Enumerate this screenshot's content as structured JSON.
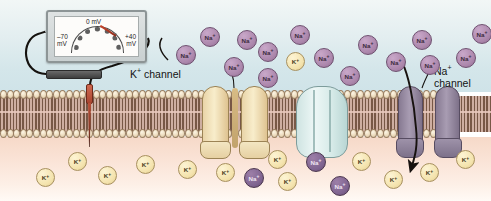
{
  "figure": {
    "type": "cell-membrane-diagram"
  },
  "voltmeter": {
    "name": "voltmeter",
    "scale_min_label": "–70\nmV",
    "scale_min_top": "–70",
    "scale_min_bottom": "mV",
    "scale_zero": "0 mV",
    "scale_max_top": "+40",
    "scale_max_bottom": "mV",
    "needle_reading_mv": -70,
    "needle_angle_deg": 33
  },
  "electrodes": {
    "reference_electrode": "reference-electrode",
    "microelectrode": "intracellular-microelectrode"
  },
  "labels": {
    "k_channel_text": "K",
    "k_channel_sup": "+",
    "k_channel_suffix": " channel",
    "na_channel_text": "Na",
    "na_channel_sup": "+",
    "na_channel_suffix": "channel"
  },
  "membrane": {
    "name": "phospholipid-bilayer",
    "head_count": 69,
    "head_color": "#f6ead2",
    "tail_color": "#6d4b38"
  },
  "compartments": {
    "extracellular": {
      "name": "extracellular-fluid",
      "color": "#d4e6ea"
    },
    "intracellular": {
      "name": "cytoplasm",
      "color": "#fae3d6"
    }
  },
  "channels": [
    {
      "name": "k-channel-protein",
      "label": "K+ channel",
      "color": "#e9d4a8",
      "state": "open",
      "x": 202
    },
    {
      "name": "closed-channel-protein",
      "label": "",
      "color": "#cfe4e2",
      "state": "closed",
      "x": 296
    },
    {
      "name": "na-channel-protein",
      "label": "Na+ channel",
      "color": "#a89cb2",
      "state": "open",
      "x": 398
    }
  ],
  "flow_arrow": {
    "name": "sodium-influx-arrow",
    "direction": "inward",
    "ion": "Na+"
  },
  "ions": {
    "sodium_symbol": "Na",
    "potassium_symbol": "K",
    "charge": "+",
    "extracellular_sodium": [
      {
        "x": 176,
        "y": 45
      },
      {
        "x": 200,
        "y": 27
      },
      {
        "x": 224,
        "y": 57
      },
      {
        "x": 237,
        "y": 30
      },
      {
        "x": 258,
        "y": 42
      },
      {
        "x": 258,
        "y": 68
      },
      {
        "x": 290,
        "y": 25
      },
      {
        "x": 314,
        "y": 48
      },
      {
        "x": 340,
        "y": 66
      },
      {
        "x": 358,
        "y": 35
      },
      {
        "x": 386,
        "y": 52
      },
      {
        "x": 412,
        "y": 30
      },
      {
        "x": 420,
        "y": 55
      },
      {
        "x": 456,
        "y": 48
      },
      {
        "x": 472,
        "y": 24
      }
    ],
    "extracellular_potassium": [
      {
        "x": 286,
        "y": 52
      }
    ],
    "intracellular_potassium": [
      {
        "x": 36,
        "y": 168
      },
      {
        "x": 68,
        "y": 152
      },
      {
        "x": 98,
        "y": 166
      },
      {
        "x": 136,
        "y": 155
      },
      {
        "x": 178,
        "y": 160
      },
      {
        "x": 216,
        "y": 163
      },
      {
        "x": 268,
        "y": 150
      },
      {
        "x": 278,
        "y": 172
      },
      {
        "x": 352,
        "y": 152
      },
      {
        "x": 384,
        "y": 170
      },
      {
        "x": 420,
        "y": 163
      },
      {
        "x": 456,
        "y": 150
      }
    ],
    "intracellular_sodium": [
      {
        "x": 244,
        "y": 168
      },
      {
        "x": 306,
        "y": 152
      },
      {
        "x": 330,
        "y": 176
      }
    ]
  }
}
